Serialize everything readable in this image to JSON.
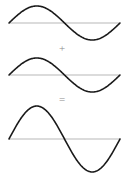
{
  "figure": {
    "background_color": "#ffffff",
    "width": 124,
    "height": 175
  },
  "operators": {
    "plus": "+",
    "equals": "=",
    "color": "#8d8d8d"
  },
  "style": {
    "wave_color": "#1a1a1a",
    "wave_stroke_width": 1.6,
    "axis_color": "#cfcfcf",
    "axis_stroke_width": 1.4
  },
  "panels": [
    {
      "name": "wave-1",
      "label": "first sine wave",
      "axis_y": 23,
      "amplitude": 17,
      "cycles": 1,
      "phase": "positive-first",
      "x_start": 9,
      "x_end": 120
    },
    {
      "name": "wave-2",
      "label": "second sine wave",
      "axis_y": 23,
      "amplitude": 17,
      "cycles": 1,
      "phase": "positive-first",
      "x_start": 9,
      "x_end": 120
    },
    {
      "name": "wave-sum",
      "label": "resultant sine wave (sum)",
      "axis_y": 36,
      "amplitude": 33,
      "cycles": 1,
      "phase": "positive-first",
      "x_start": 9,
      "x_end": 120
    }
  ],
  "chart_data": {
    "type": "line",
    "xlabel": "",
    "ylabel": "",
    "grid": false,
    "legend": "none",
    "xlim": [
      0,
      1
    ],
    "series": [
      {
        "name": "wave 1",
        "panel": 1,
        "equation": "y = A sin(2πx)",
        "amplitude": 1,
        "wavelength": 1,
        "phase_deg": 0,
        "x": [
          0,
          0.0625,
          0.125,
          0.1875,
          0.25,
          0.3125,
          0.375,
          0.4375,
          0.5,
          0.5625,
          0.625,
          0.6875,
          0.75,
          0.8125,
          0.875,
          0.9375,
          1
        ],
        "values": [
          0,
          0.383,
          0.707,
          0.924,
          1,
          0.924,
          0.707,
          0.383,
          0,
          -0.383,
          -0.707,
          -0.924,
          -1,
          -0.924,
          -0.707,
          -0.383,
          0
        ]
      },
      {
        "name": "wave 2",
        "panel": 2,
        "equation": "y = A sin(2πx)",
        "amplitude": 1,
        "wavelength": 1,
        "phase_deg": 0,
        "x": [
          0,
          0.0625,
          0.125,
          0.1875,
          0.25,
          0.3125,
          0.375,
          0.4375,
          0.5,
          0.5625,
          0.625,
          0.6875,
          0.75,
          0.8125,
          0.875,
          0.9375,
          1
        ],
        "values": [
          0,
          0.383,
          0.707,
          0.924,
          1,
          0.924,
          0.707,
          0.383,
          0,
          -0.383,
          -0.707,
          -0.924,
          -1,
          -0.924,
          -0.707,
          -0.383,
          0
        ]
      },
      {
        "name": "resultant wave",
        "panel": 3,
        "equation": "y = 2A sin(2πx)",
        "amplitude": 2,
        "wavelength": 1,
        "phase_deg": 0,
        "x": [
          0,
          0.0625,
          0.125,
          0.1875,
          0.25,
          0.3125,
          0.375,
          0.4375,
          0.5,
          0.5625,
          0.625,
          0.6875,
          0.75,
          0.8125,
          0.875,
          0.9375,
          1
        ],
        "values": [
          0,
          0.765,
          1.414,
          1.848,
          2,
          1.848,
          1.414,
          0.765,
          0,
          -0.765,
          -1.414,
          -1.848,
          -2,
          -1.848,
          -1.414,
          -0.765,
          0
        ]
      }
    ]
  }
}
